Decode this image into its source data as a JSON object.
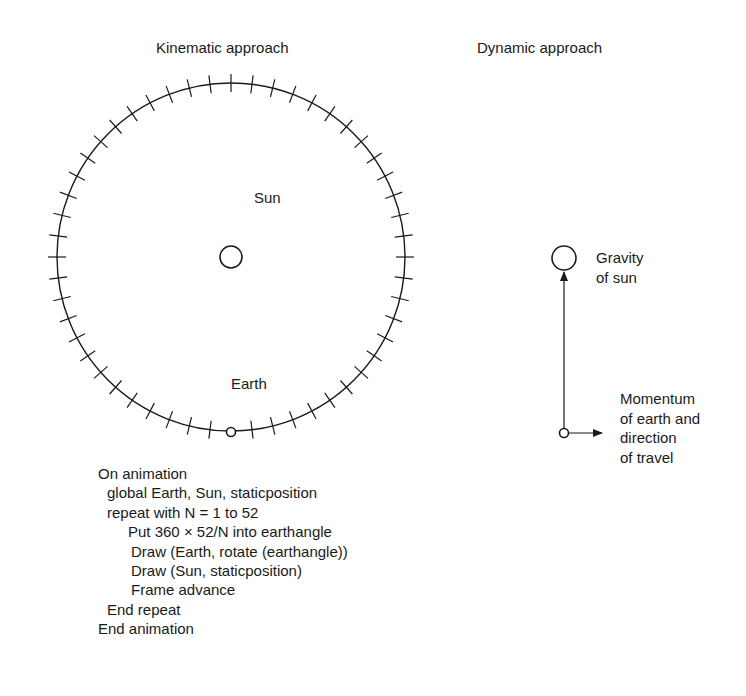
{
  "titles": {
    "kinematic": "Kinematic approach",
    "dynamic": "Dynamic approach"
  },
  "kinematic": {
    "sun_label": "Sun",
    "earth_label": "Earth",
    "tick_count": 52
  },
  "dynamic": {
    "gravity_label": [
      "Gravity",
      "of sun"
    ],
    "momentum_label": [
      "Momentum",
      "of earth and",
      "direction",
      "of travel"
    ]
  },
  "code": {
    "lines": [
      {
        "indent": 0,
        "text": "On animation"
      },
      {
        "indent": 1,
        "text": "global Earth, Sun, staticposition"
      },
      {
        "indent": 1,
        "text": "repeat with N = 1 to 52"
      },
      {
        "indent": 2,
        "text": "Put 360 × 52/N into earthangle"
      },
      {
        "indent": 3,
        "text": "Draw (Earth, rotate (earthangle))"
      },
      {
        "indent": 3,
        "text": "Draw (Sun, staticposition)"
      },
      {
        "indent": 3,
        "text": "Frame advance"
      },
      {
        "indent": 1,
        "text": "End repeat"
      },
      {
        "indent": 0,
        "text": "End animation"
      }
    ]
  }
}
